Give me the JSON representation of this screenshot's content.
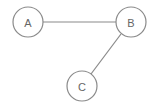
{
  "diagram": {
    "type": "graph",
    "nodes": [
      {
        "id": "A",
        "label": "A",
        "cx": 28,
        "cy": 22,
        "r": 15
      },
      {
        "id": "B",
        "label": "B",
        "cx": 131,
        "cy": 22,
        "r": 15
      },
      {
        "id": "C",
        "label": "C",
        "cx": 82,
        "cy": 86,
        "r": 15
      }
    ],
    "edges": [
      {
        "from": "A",
        "to": "B"
      },
      {
        "from": "B",
        "to": "C"
      }
    ],
    "colors": {
      "stroke": "#8a8a8a",
      "label": "#666666",
      "background": "#ffffff"
    }
  }
}
